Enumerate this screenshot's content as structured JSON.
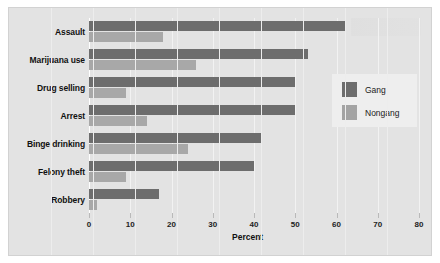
{
  "chart_data": {
    "type": "bar",
    "orientation": "horizontal",
    "title": "",
    "subtitle": "",
    "xlabel": "Percent",
    "ylabel": "",
    "xlim": [
      0,
      80
    ],
    "xticks": [
      0,
      10,
      20,
      30,
      40,
      50,
      60,
      70,
      80
    ],
    "xtick_labels": [
      "0",
      "10",
      "20",
      "30",
      "40",
      "50",
      "60",
      "70",
      "80"
    ],
    "grid": true,
    "legend_position": "right",
    "categories": [
      "Assault",
      "Marijuana use",
      "Drug selling",
      "Arrest",
      "Binge drinking",
      "Felony theft",
      "Robbery"
    ],
    "series": [
      {
        "name": "Gang",
        "color": "#6d6d6d",
        "values": [
          62,
          53,
          50,
          50,
          42,
          40,
          17
        ]
      },
      {
        "name": "Nongang",
        "color": "#a8a8a8",
        "values": [
          18,
          26,
          9,
          14,
          24,
          9,
          2
        ]
      }
    ]
  },
  "legend": {
    "entries": [
      {
        "label": "Gang",
        "swatch": "gang"
      },
      {
        "label": "Nongang",
        "swatch": "nongang"
      }
    ]
  },
  "colors": {
    "gang": "#6d6d6d",
    "nongang": "#a8a8a8",
    "panel_background": "#e3e3e3",
    "legend_background": "#eeeeee",
    "gridline": "#f2f2f2"
  }
}
